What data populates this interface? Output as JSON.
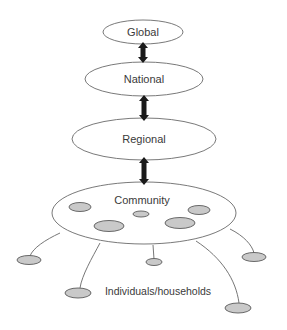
{
  "diagram": {
    "type": "hierarchy",
    "levels": [
      {
        "id": "global",
        "label": "Global"
      },
      {
        "id": "national",
        "label": "National"
      },
      {
        "id": "regional",
        "label": "Regional"
      },
      {
        "id": "community",
        "label": "Community"
      }
    ],
    "connections": [
      {
        "from": "global",
        "to": "national",
        "style": "double-arrow"
      },
      {
        "from": "national",
        "to": "regional",
        "style": "double-arrow"
      },
      {
        "from": "regional",
        "to": "community",
        "style": "double-arrow"
      }
    ],
    "community_members_inside": 5,
    "outer_individuals": 6,
    "individuals_label": "Individuals/households",
    "colors": {
      "level_stroke": "#6a6a6a",
      "node_fill": "#c9c9c9",
      "arrow": "#1a1a1a"
    }
  }
}
